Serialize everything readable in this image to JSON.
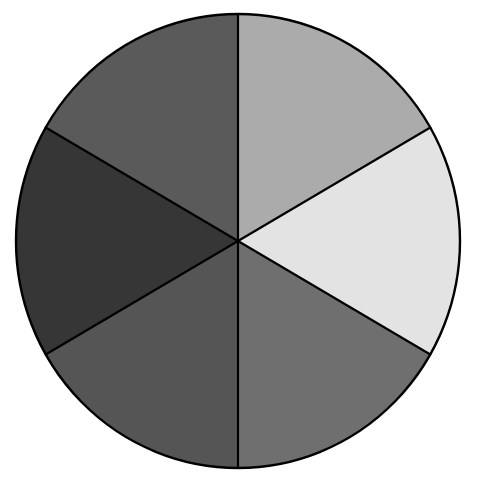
{
  "diagram": {
    "type": "segmented-circle",
    "segment_count": 6,
    "segment_angle_deg": 60,
    "outline_color": "#000000",
    "background_color": "#ffffff",
    "segments": [
      {
        "id": "top-right",
        "fill": "#ababab"
      },
      {
        "id": "right",
        "fill": "#e3e3e3"
      },
      {
        "id": "bottom-right",
        "fill": "#6f6f6f"
      },
      {
        "id": "bottom-left",
        "fill": "#555555"
      },
      {
        "id": "left",
        "fill": "#363636"
      },
      {
        "id": "top-left",
        "fill": "#5a5a5a"
      }
    ]
  }
}
